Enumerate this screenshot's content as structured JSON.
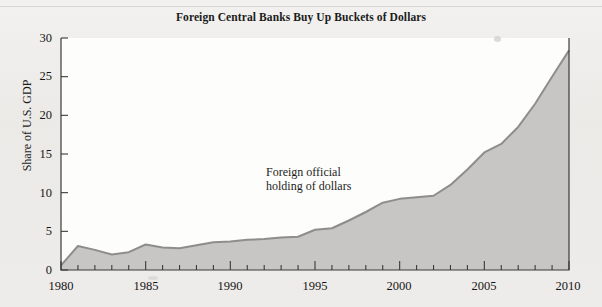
{
  "figure": {
    "title": "Foreign Central Banks Buy Up Buckets of Dollars",
    "annotation": "Foreign official\nholding of dollars"
  },
  "axes": {
    "y_label": "Share of U.S. GDP",
    "y_ticks": [
      "0",
      "5",
      "10",
      "15",
      "20",
      "25",
      "30"
    ],
    "x_ticks": [
      "1980",
      "1985",
      "1990",
      "1995",
      "2000",
      "2005",
      "2010"
    ]
  },
  "colors": {
    "area_fill": "#c7c6c4",
    "area_line": "#8e8d8b",
    "axis": "#3a3a3a",
    "page": "#efeeec",
    "plot_bg": "#fdfdfc",
    "text": "#1b1b1b"
  },
  "chart_data": {
    "type": "area",
    "title": "Foreign Central Banks Buy Up Buckets of Dollars",
    "xlabel": "",
    "ylabel": "Share of U.S. GDP",
    "xlim": [
      1980,
      2010
    ],
    "ylim": [
      0,
      30
    ],
    "grid": false,
    "legend": "none",
    "annotations": [
      {
        "text": "Foreign official holding of dollars",
        "x": 1994.5,
        "y": 13.5
      }
    ],
    "series": [
      {
        "name": "Foreign official holding of dollars",
        "x": [
          1980,
          1981,
          1982,
          1983,
          1984,
          1985,
          1986,
          1987,
          1988,
          1989,
          1990,
          1991,
          1992,
          1993,
          1994,
          1995,
          1996,
          1997,
          1998,
          1999,
          2000,
          2001,
          2002,
          2003,
          2004,
          2005,
          2006,
          2007,
          2008,
          2009,
          2010
        ],
        "values": [
          0.6,
          3.1,
          2.6,
          2.0,
          2.3,
          3.3,
          2.9,
          2.8,
          3.2,
          3.6,
          3.7,
          3.9,
          4.0,
          4.2,
          4.3,
          5.2,
          5.4,
          6.4,
          7.5,
          8.7,
          9.2,
          9.4,
          9.6,
          11.0,
          13.0,
          15.2,
          16.3,
          18.5,
          21.5,
          25.0,
          28.4
        ]
      }
    ]
  }
}
